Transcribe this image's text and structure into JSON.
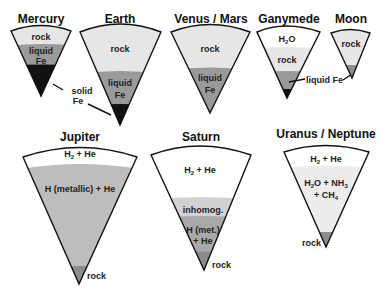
{
  "colors": {
    "rock": "#e4e4e4",
    "liquid_fe": "#9a9a9a",
    "solid_fe": "#111111",
    "gas": "#ffffff",
    "h2o": "#ffffff",
    "metallic_h": "#b8b8b8",
    "inhomog": "#d2d2d2",
    "ices": "#ececec",
    "core_rock": "#8c8c8c"
  },
  "bodies": [
    {
      "name": "Mercury",
      "layers": [
        "rock",
        "liquid Fe",
        "solid Fe"
      ]
    },
    {
      "name": "Earth",
      "layers": [
        "rock",
        "liquid Fe",
        "solid Fe"
      ]
    },
    {
      "name": "Venus / Mars",
      "layers": [
        "rock",
        "liquid Fe"
      ]
    },
    {
      "name": "Ganymede",
      "layers": [
        "H2O",
        "rock",
        "liquid Fe",
        "solid Fe"
      ]
    },
    {
      "name": "Moon",
      "layers": [
        "rock",
        "liquid Fe"
      ]
    },
    {
      "name": "Jupiter",
      "layers": [
        "H2 + He",
        "H (metallic) + He",
        "rock"
      ]
    },
    {
      "name": "Saturn",
      "layers": [
        "H2 + He",
        "inhomog.",
        "H (met.) + He",
        "rock"
      ]
    },
    {
      "name": "Uranus / Neptune",
      "layers": [
        "H2 + He",
        "H2O + NH3 + CH4",
        "rock"
      ]
    }
  ],
  "labels": {
    "mercury": {
      "title": "Mercury",
      "rock": "rock",
      "liquid": "liquid",
      "fe": "Fe"
    },
    "earth": {
      "title": "Earth",
      "rock": "rock",
      "liquid": "liquid",
      "fe": "Fe"
    },
    "venus_mars": {
      "title": "Venus / Mars",
      "rock": "rock",
      "liquid": "liquid",
      "fe": "Fe"
    },
    "ganymede": {
      "title": "Ganymede",
      "h2o_h": "H",
      "h2o_sub": "2",
      "h2o_o": "O",
      "rock": "rock"
    },
    "moon": {
      "title": "Moon",
      "rock": "rock"
    },
    "solid_fe": {
      "line1": "solid",
      "line2": "Fe"
    },
    "liquid_fe_callout": "liquid Fe",
    "jupiter": {
      "title": "Jupiter",
      "gas_h": "H",
      "gas_sub": "2",
      "gas_rest": " + He",
      "metallic": "H (metallic) + He",
      "rock": "rock"
    },
    "saturn": {
      "title": "Saturn",
      "gas_h": "H",
      "gas_sub": "2",
      "gas_rest": " + He",
      "inhomog": "inhomog.",
      "met1": "H (met.)",
      "met2": "+ He",
      "rock": "rock"
    },
    "uranus_neptune": {
      "title": "Uranus / Neptune",
      "gas_h": "H",
      "gas_sub": "2",
      "gas_rest": " + He",
      "ices_l1_a": "H",
      "ices_l1_s1": "2",
      "ices_l1_b": "O + NH",
      "ices_l1_s2": "3",
      "ices_l2_a": "+ CH",
      "ices_l2_s": "4",
      "rock": "rock"
    }
  }
}
